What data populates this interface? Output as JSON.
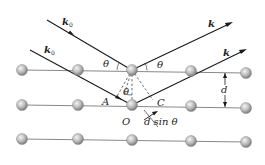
{
  "diagram": {
    "type": "bragg-diffraction",
    "labels": {
      "k0_upper": "k",
      "k0_upper_sub": "0",
      "k0_lower": "k",
      "k0_lower_sub": "0",
      "k_upper": "k",
      "k_lower": "k",
      "theta_in": "θ",
      "theta_out": "θ",
      "theta_mid": "θ",
      "point_A": "A",
      "point_C": "C",
      "point_O": "O",
      "spacing_d": "d",
      "path_diff": "d sin θ"
    },
    "atom_rows": [
      {
        "name": "top-plane",
        "atoms": [
          [
            22,
            70
          ],
          [
            78,
            70
          ],
          [
            132,
            70
          ],
          [
            191,
            71
          ],
          [
            246,
            73
          ]
        ]
      },
      {
        "name": "middle-plane",
        "atoms": [
          [
            22,
            105
          ],
          [
            78,
            105
          ],
          [
            132,
            105
          ],
          [
            191,
            106
          ],
          [
            246,
            108
          ]
        ]
      },
      {
        "name": "bottom-plane",
        "atoms": [
          [
            22,
            139
          ],
          [
            78,
            139
          ],
          [
            132,
            140
          ],
          [
            191,
            141
          ],
          [
            246,
            142
          ]
        ]
      }
    ],
    "colors": {
      "atom_fill_light": "#e8e8e8",
      "atom_fill_dark": "#8a8a8a",
      "lattice_line": "#777777",
      "ray": "#1a1a1a"
    }
  }
}
